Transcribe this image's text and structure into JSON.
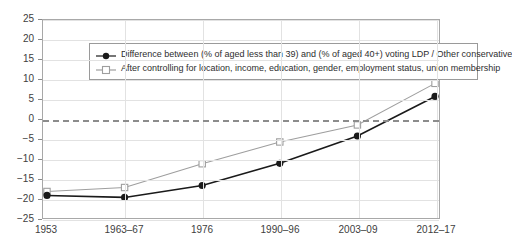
{
  "chart_data": {
    "type": "line",
    "title": "",
    "xlabel": "",
    "ylabel": "",
    "categories": [
      "1953",
      "1963–67",
      "1976",
      "1990–96",
      "2003–09",
      "2012–17"
    ],
    "ylim": [
      -25,
      25
    ],
    "yticks": [
      "25",
      "20",
      "15",
      "10",
      "5",
      "0",
      "−5",
      "−10",
      "−15",
      "−20",
      "−25"
    ],
    "ytick_values": [
      25,
      20,
      15,
      10,
      5,
      0,
      -5,
      -10,
      -15,
      -20,
      -25
    ],
    "grid": true,
    "legend_position": "top-left",
    "zero_reference_line": 0,
    "series": [
      {
        "name": "Difference between (% of aged less than 39) and (% of aged 40+) voting LDP / Other conservative",
        "marker": "filled-circle",
        "color": "#1a1a1a",
        "values": [
          -19.3,
          -19.8,
          -16.8,
          -11.2,
          -4.3,
          5.7
        ]
      },
      {
        "name": "After controlling for location, income, education, gender, employment status, union membership",
        "marker": "open-square",
        "color": "#9e9e9e",
        "values": [
          -18.3,
          -17.3,
          -11.3,
          -5.8,
          -1.5,
          9.0
        ]
      }
    ]
  },
  "colors": {
    "series_primary": "#1a1a1a",
    "series_secondary": "#9e9e9e",
    "grid": "#e2e2e2",
    "frame": "#a8a8a8",
    "zero_line": "#8c8c8c",
    "text": "#404040",
    "background": "#ffffff"
  }
}
